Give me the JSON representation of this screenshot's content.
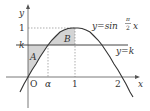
{
  "figure": {
    "curve_label_prefix": "y=sin",
    "curve_frac_num": "π",
    "curve_frac_den": "2",
    "curve_label_suffix": "x",
    "line_label": "y=k",
    "y_axis_label": "y",
    "x_axis_label": "x",
    "origin_label": "O",
    "tick_y_one": "1",
    "tick_y_k": "k",
    "tick_x_alpha": "α",
    "tick_x_one": "1",
    "tick_x_two": "2",
    "region_a_label": "A",
    "region_b_label": "B",
    "colors": {
      "line": "#333333",
      "shade": "#d4d4d4",
      "dashed": "#777777"
    }
  }
}
